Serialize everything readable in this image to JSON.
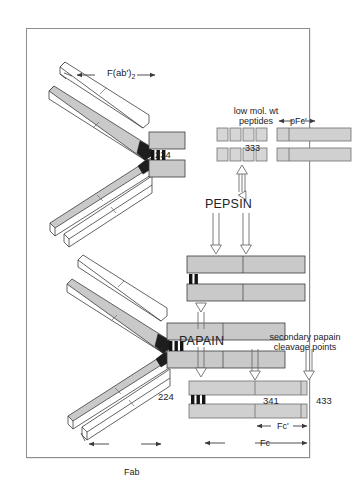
{
  "page": {
    "running_head": "IMMUNOGLOBULINS  AND  THEIR  PROTEOLYTIC  CLEAVAGE",
    "background": "#ffffff",
    "frame_border": "#8e8e92"
  },
  "figure": {
    "colors": {
      "heavy_chain_fill": "#c9c9c9",
      "light_chain_fill": "#ffffff",
      "outline": "#444444",
      "hinge_dark": "#1a1a1a",
      "bar_fill": "#d0d0d0",
      "bar_fill_light": "#e2e2e2",
      "arrow_stroke": "#6e6e72",
      "text": "#232326"
    },
    "labels": {
      "fab2": "F(ab')",
      "fab2_sub": "2",
      "residue_234": "234",
      "residue_224": "224",
      "low_mol_wt": "low mol. wt\npeptides",
      "low_mol_wt_line1": "low mol. wt",
      "low_mol_wt_line2": "peptides",
      "pfc_prime": "pFc'",
      "residue_333": "333",
      "pepsin": "PEPSIN",
      "papain": "PAPAIN",
      "secondary_line1": "secondary papain",
      "secondary_line2": "cleavage points",
      "residue_341": "341",
      "residue_433": "433",
      "fc_prime": "Fc'",
      "fc": "Fc",
      "fab": "Fab"
    },
    "enzymes": [
      {
        "name": "PEPSIN",
        "products": [
          "F(ab')2",
          "pFc'",
          "low mol. wt peptides"
        ],
        "cleavage_residue": "234",
        "arrow_count_down": 2,
        "arrow_count_up": 1
      },
      {
        "name": "PAPAIN",
        "products": [
          "Fab",
          "Fc"
        ],
        "cleavage_residue": "224",
        "arrow_count_down": 1,
        "arrow_count_up": 0
      }
    ],
    "secondary_cleavage": {
      "label": "secondary papain cleavage points",
      "residues": [
        "341",
        "433"
      ]
    },
    "peptide_rows": [
      {
        "boxes": 4
      },
      {
        "boxes": 4
      }
    ],
    "pfc_bars": 2,
    "fc_bars": 2,
    "measure_bars": [
      {
        "name": "F(ab')2",
        "label": "F(ab')"
      },
      {
        "name": "pFc'",
        "label": "pFc'"
      },
      {
        "name": "Fc'",
        "label": "Fc'"
      },
      {
        "name": "Fc",
        "label": "Fc"
      },
      {
        "name": "Fab",
        "label": "Fab"
      }
    ]
  }
}
